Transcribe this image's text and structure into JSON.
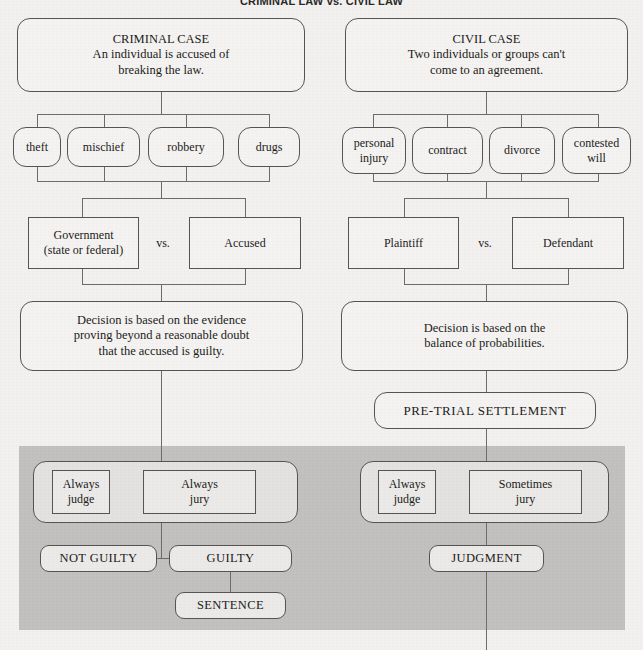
{
  "title": "CRIMINAL LAW vs. CIVIL LAW",
  "colors": {
    "page_background": "#f2f1ef",
    "shaded_band": "#c2c1c0",
    "box_border": "#565553",
    "box_fill": "#f4f3f1",
    "group_fill": "#e3e2e0",
    "connector": "#6d6c6a",
    "text": "#1c1b1a"
  },
  "criminal": {
    "header_title": "CRIMINAL CASE",
    "header_line1": "An individual is accused of",
    "header_line2": "breaking the law.",
    "examples": [
      "theft",
      "mischief",
      "robbery",
      "drugs"
    ],
    "parties": {
      "left_line1": "Government",
      "left_line2": "(state or federal)",
      "vs": "vs.",
      "right": "Accused"
    },
    "decision_line1": "Decision is based on the evidence",
    "decision_line2": "proving beyond a reasonable doubt",
    "decision_line3": "that the accused is guilty.",
    "deciders": [
      {
        "line1": "Always",
        "line2": "judge"
      },
      {
        "line1": "Always",
        "line2": "jury"
      }
    ],
    "verdicts": [
      "NOT GUILTY",
      "GUILTY"
    ],
    "outcome": "SENTENCE"
  },
  "civil": {
    "header_title": "CIVIL CASE",
    "header_line1": "Two individuals or groups can't",
    "header_line2": "come to an agreement.",
    "examples": [
      "personal injury",
      "contract",
      "divorce",
      "contested will"
    ],
    "examples_wrapped": [
      {
        "line1": "personal",
        "line2": "injury"
      },
      {
        "line1": "contract",
        "line2": ""
      },
      {
        "line1": "divorce",
        "line2": ""
      },
      {
        "line1": "contested",
        "line2": "will"
      }
    ],
    "parties": {
      "left": "Plaintiff",
      "vs": "vs.",
      "right": "Defendant"
    },
    "decision_line1": "Decision is based on the",
    "decision_line2": "balance of probabilities.",
    "settlement": "PRE-TRIAL SETTLEMENT",
    "deciders": [
      {
        "line1": "Always",
        "line2": "judge"
      },
      {
        "line1": "Sometimes",
        "line2": "jury"
      }
    ],
    "outcome": "JUDGMENT"
  }
}
